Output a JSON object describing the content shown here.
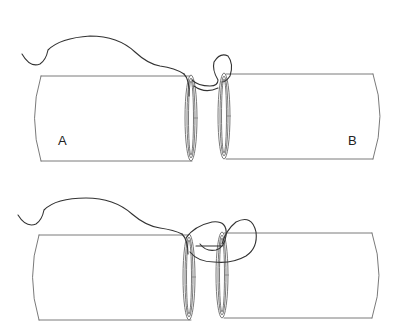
{
  "figure": {
    "panels": [
      {
        "id": "top",
        "step": 1,
        "labels": {
          "left": "A",
          "right": "B"
        }
      },
      {
        "id": "bottom",
        "step": 2,
        "labels": {
          "left": "",
          "right": ""
        }
      }
    ],
    "colors": {
      "outline": "#7a7a7a",
      "thread": "#333333",
      "background": "#ffffff"
    }
  }
}
